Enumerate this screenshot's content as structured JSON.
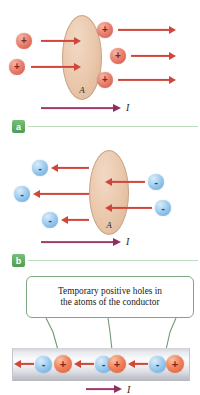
{
  "figure": {
    "panels": [
      {
        "tag": "a",
        "area_label": "A",
        "current_label": "I",
        "carrier_sign": "+",
        "carrier_count": 5,
        "carrier_direction": "right",
        "current_direction": "right"
      },
      {
        "tag": "b",
        "area_label": "A",
        "current_label": "I",
        "carrier_sign": "-",
        "carrier_count": 5,
        "carrier_direction": "left",
        "current_direction": "right"
      },
      {
        "tag": "c",
        "callout_text": "Temporary positive holes in the atoms of the conductor",
        "callout_line1": "Temporary positive holes in",
        "callout_line2": "the atoms of the conductor",
        "current_label": "I",
        "current_direction": "right",
        "chain": [
          {
            "sign": "-"
          },
          {
            "sign": "+"
          },
          {
            "sign": "-"
          },
          {
            "sign": "+"
          },
          {
            "sign": "-"
          },
          {
            "sign": "+"
          }
        ],
        "electron_drift_direction": "left",
        "leader_count": 3
      }
    ],
    "colors": {
      "positive_charge": "#cf5442",
      "negative_charge": "#5fa6dc",
      "velocity_arrow": "#d1463a",
      "current_arrow": "#8e2f62",
      "area_ellipse": "#e9c7ab",
      "panel_tag": "#4f9c55",
      "callout_border": "#7da884",
      "rule": "#bcdcbd"
    }
  }
}
